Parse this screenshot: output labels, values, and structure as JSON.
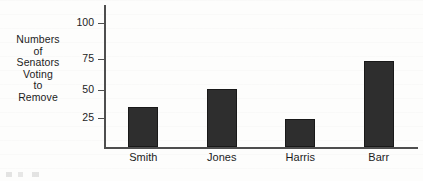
{
  "chart_data": {
    "type": "bar",
    "title": "",
    "subtitle": "",
    "xlabel": "",
    "ylabel": "Numbers of Senators Voting to Remove",
    "ylabel_lines": [
      "Numbers",
      "of",
      "Senators",
      "Voting",
      "to",
      "Remove"
    ],
    "categories": [
      "Smith",
      "Jones",
      "Harris",
      "Barr"
    ],
    "values": [
      35,
      50,
      24,
      74
    ],
    "yticks": [
      25,
      50,
      75,
      100
    ],
    "ytick_labels": [
      "25",
      "50",
      "75",
      "100"
    ],
    "ylim": [
      0,
      110
    ],
    "xlim_note": "categorical",
    "grid": false,
    "legend": false,
    "legend_position": "none",
    "bar_color": "#2e2e2e",
    "axis_color": "#4e4e4e",
    "text_color": "#1c1c1c",
    "background_color": "#fdfdfc"
  }
}
